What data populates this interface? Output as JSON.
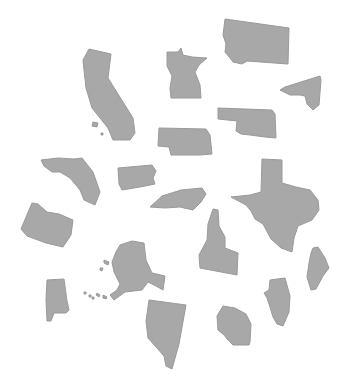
{
  "canvas": {
    "width": 343,
    "height": 379,
    "background": "#ffffff"
  },
  "style": {
    "fill": "#a8a8a8",
    "stroke": "#9a9a9a"
  },
  "shapes": [
    {
      "name": "california",
      "points": "89,49 111,54 108,78 133,118 135,133 130,140 113,140 108,128 92,108 86,88 84,70 83,60"
    },
    {
      "name": "california-island-1",
      "points": "93,122 98,123 97,127 92,126"
    },
    {
      "name": "california-island-2",
      "points": "101,133 103,133 103,135 101,135"
    },
    {
      "name": "montana",
      "points": "225,19 289,28 288,64 247,61 242,64 233,62 230,58 225,52 226,44 223,35"
    },
    {
      "name": "minnesota",
      "points": "167,52 178,52 181,48 183,55 192,57 207,58 199,65 195,72 200,85 201,98 171,98 170,88 172,76 167,66"
    },
    {
      "name": "new-york",
      "points": "285,87 320,76 321,80 319,105 313,110 307,104 305,96 300,95 290,95 280,90"
    },
    {
      "name": "oklahoma",
      "points": "218,108 272,110 275,114 276,138 265,137 250,135 241,134 236,131 237,121 218,119"
    },
    {
      "name": "nebraska",
      "points": "159,128 206,129 210,135 212,154 200,155 186,155 171,155 169,147 158,146"
    },
    {
      "name": "florida",
      "points": "41,160 58,158 74,159 82,158 93,172 100,192 95,205 84,200 80,190 70,178 60,172 52,172 44,166"
    },
    {
      "name": "pennsylvania",
      "points": "118,168 152,165 156,171 153,178 155,184 140,187 122,190 119,184"
    },
    {
      "name": "north-carolina",
      "points": "150,207 162,196 181,190 202,188 206,194 201,202 193,210 180,207 165,208"
    },
    {
      "name": "texas",
      "points": "262,159 282,160 282,183 296,187 310,190 318,200 319,210 312,220 298,226 294,238 292,252 281,248 271,239 263,224 255,219 251,211 246,205 231,197 250,195 261,192"
    },
    {
      "name": "oregon",
      "points": "32,203 38,204 47,212 59,214 73,220 71,235 63,247 46,243 27,236 21,229"
    },
    {
      "name": "idaho",
      "points": "213,209 218,210 219,226 225,237 225,248 238,253 237,275 200,268 199,255 207,240 208,224"
    },
    {
      "name": "alaska",
      "points": "120,245 132,241 144,243 146,260 152,273 165,276 163,290 156,286 148,282 142,290 125,292 114,300 110,295 117,290 120,284 114,272 112,262 116,252"
    },
    {
      "name": "alaska-island-1",
      "points": "104,260 109,262 108,265 104,263"
    },
    {
      "name": "alaska-island-2",
      "points": "100,268 103,268 102,271 100,270"
    },
    {
      "name": "alaska-island-3",
      "points": "103,295 107,297 106,299 103,298"
    },
    {
      "name": "alaska-island-4",
      "points": "97,293 100,295 99,297 96,295"
    },
    {
      "name": "alaska-island-5",
      "points": "84,292 86,292 86,294 84,294"
    },
    {
      "name": "alaska-island-6",
      "points": "89,295 91,295 91,297 89,297"
    },
    {
      "name": "alaska-island-7",
      "points": "92,297 94,297 94,299 92,299"
    },
    {
      "name": "maine",
      "points": "313,248 318,247 325,258 329,268 323,276 316,289 311,290 307,277 309,263 311,253"
    },
    {
      "name": "alabama",
      "points": "47,280 64,279 67,301 69,310 66,313 54,313 51,321 47,321 46,300"
    },
    {
      "name": "illinois",
      "points": "270,280 285,278 290,296 289,312 283,326 277,324 273,317 270,307 267,298 264,293 269,290"
    },
    {
      "name": "nevada",
      "points": "149,300 186,305 179,344 172,369 166,366 164,356 148,338 146,321"
    },
    {
      "name": "wisconsin",
      "points": "223,306 235,308 246,314 251,324 250,342 249,345 233,345 228,340 224,335 218,330 217,316"
    }
  ]
}
